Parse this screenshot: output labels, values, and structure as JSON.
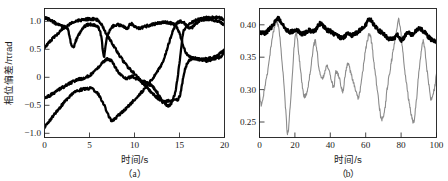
{
  "figure": {
    "background_color": "#ffffff",
    "text_color": "#1a1a1a",
    "black_curve_color": "#000000",
    "gray_curve_color": "#8c8c8c"
  },
  "panel_a": {
    "caption": "（a）",
    "xlabel": "时间/s",
    "ylabel": "相位偏差/πrad",
    "xticks": [
      "0",
      "5",
      "10",
      "15",
      "20"
    ],
    "yticks": [
      "1.0",
      "0.5",
      "0",
      "−0.5",
      "−1.0"
    ]
  },
  "panel_b": {
    "caption": "（b）",
    "xlabel": "时间/s",
    "xticks": [
      "0",
      "20",
      "40",
      "60",
      "80",
      "100"
    ],
    "yticks": [
      "0.25",
      "0.30",
      "0.35",
      "0.40"
    ]
  },
  "chart_data": [
    {
      "type": "line",
      "id": "panel-a",
      "title": "",
      "subtitle": "（a）",
      "xlabel": "时间/s",
      "ylabel": "相位偏差/πrad",
      "xlim": [
        0,
        20
      ],
      "ylim": [
        -1.15,
        1.15
      ],
      "xticks": [
        0,
        5,
        10,
        15,
        20
      ],
      "yticks": [
        1.0,
        0.5,
        0,
        -0.5,
        -1.0
      ],
      "grid": false,
      "legend": "none",
      "noise": "all traces carry fine high-frequency jitter of roughly ±0.02 πrad",
      "series": [
        {
          "name": "trace-1",
          "color": "#000000",
          "linewidth": "thick",
          "x": [
            0,
            0.6,
            1.3,
            2.0,
            2.6,
            3.1,
            3.6,
            4.2,
            4.8,
            5.4,
            5.9,
            6.3,
            6.6,
            6.9,
            7.4,
            8.0,
            8.6,
            9.2,
            9.6,
            10.0,
            10.6,
            11.2,
            11.8,
            12.4,
            13.0,
            13.6,
            14.2,
            14.6,
            15.0,
            15.6,
            16.2,
            16.8,
            17.4,
            18.0,
            18.6,
            19.2,
            19.6,
            20
          ],
          "y": [
            0.99,
            0.95,
            0.88,
            0.83,
            0.78,
            0.45,
            0.62,
            0.79,
            0.86,
            0.86,
            0.83,
            0.66,
            0.3,
            0.62,
            0.8,
            0.86,
            0.84,
            0.8,
            0.88,
            0.83,
            0.8,
            0.83,
            0.86,
            0.88,
            0.9,
            0.9,
            0.88,
            0.84,
            0.7,
            0.4,
            0.28,
            0.26,
            0.24,
            0.25,
            0.27,
            0.3,
            0.36,
            0.42
          ]
        },
        {
          "name": "trace-2",
          "color": "#000000",
          "linewidth": "thick",
          "x": [
            0,
            0.8,
            1.6,
            2.4,
            3.2,
            4.0,
            4.8,
            5.6,
            6.2,
            6.8,
            7.4,
            8.0,
            8.6,
            9.2,
            9.6,
            10.2,
            10.8,
            11.4,
            12.0,
            12.6,
            13.2,
            13.8,
            14.2,
            14.6,
            15.0,
            15.4,
            16.0,
            16.6,
            17.2,
            17.8,
            18.4,
            19.0,
            19.5,
            20
          ],
          "y": [
            0.46,
            0.6,
            0.72,
            0.83,
            0.9,
            0.94,
            0.96,
            0.96,
            0.9,
            0.72,
            0.56,
            0.4,
            0.25,
            0.12,
            0.05,
            -0.05,
            -0.16,
            -0.26,
            -0.36,
            -0.45,
            -0.52,
            -0.58,
            -0.5,
            -0.28,
            0.18,
            0.72,
            0.86,
            0.92,
            0.96,
            0.98,
            0.99,
            0.99,
            0.98,
            0.95
          ]
        },
        {
          "name": "trace-3",
          "color": "#000000",
          "linewidth": "thick",
          "x": [
            0,
            0.6,
            1.2,
            1.8,
            2.4,
            3.0,
            3.6,
            4.2,
            4.8,
            5.4,
            6.0,
            6.6,
            7.0,
            7.4,
            7.8,
            8.2,
            8.6,
            9.0,
            9.4,
            9.8,
            10.2,
            10.8,
            11.4,
            12.0,
            12.4,
            12.8,
            13.2,
            13.8,
            14.4,
            15.0,
            15.6,
            16.2,
            16.8,
            17.4,
            18.0,
            18.6,
            19.2,
            19.6,
            20
          ],
          "y": [
            -0.44,
            -0.4,
            -0.34,
            -0.28,
            -0.22,
            -0.17,
            -0.12,
            -0.1,
            -0.06,
            0.0,
            0.1,
            0.2,
            0.25,
            0.22,
            0.12,
            0.02,
            -0.04,
            -0.1,
            -0.08,
            -0.06,
            -0.1,
            -0.14,
            -0.18,
            -0.24,
            -0.32,
            -0.42,
            -0.5,
            -0.5,
            -0.48,
            -0.42,
            0.06,
            0.24,
            0.26,
            0.24,
            0.22,
            0.24,
            0.26,
            0.3,
            0.38
          ]
        },
        {
          "name": "trace-4",
          "color": "#000000",
          "linewidth": "thick",
          "x": [
            0,
            0.5,
            1.0,
            1.6,
            2.2,
            2.8,
            3.4,
            4.0,
            4.6,
            5.2,
            5.8,
            6.2,
            6.6,
            7.0,
            7.4,
            7.8,
            8.2,
            8.6,
            9.0,
            9.6,
            10.2,
            10.8,
            11.4,
            12.0,
            12.6,
            13.2,
            13.8,
            14.4,
            15.0,
            15.6,
            16.2,
            16.8,
            17.4,
            18.0,
            18.6,
            19.2,
            19.6,
            20
          ],
          "y": [
            -0.96,
            -0.86,
            -0.76,
            -0.64,
            -0.52,
            -0.42,
            -0.34,
            -0.3,
            -0.28,
            -0.28,
            -0.34,
            -0.44,
            -0.56,
            -0.72,
            -0.84,
            -0.82,
            -0.76,
            -0.7,
            -0.64,
            -0.54,
            -0.44,
            -0.34,
            -0.22,
            -0.1,
            0.04,
            0.22,
            0.52,
            0.8,
            0.92,
            0.88,
            0.8,
            0.88,
            0.94,
            0.96,
            0.95,
            0.93,
            0.9,
            0.86
          ]
        }
      ]
    },
    {
      "type": "line",
      "id": "panel-b",
      "title": "",
      "subtitle": "（b）",
      "xlabel": "时间/s",
      "ylabel": "",
      "xlim": [
        0,
        100
      ],
      "ylim": [
        0.225,
        0.418
      ],
      "xticks": [
        0,
        20,
        40,
        60,
        80,
        100
      ],
      "yticks": [
        0.25,
        0.3,
        0.35,
        0.4
      ],
      "grid": false,
      "legend": "none",
      "series": [
        {
          "name": "stabilized-trace",
          "color": "#000000",
          "linewidth": "thick",
          "description": "nearly flat noisy trace fluctuating about 0.38",
          "x": [
            0,
            2,
            4,
            6,
            8,
            10,
            12,
            14,
            16,
            18,
            20,
            22,
            24,
            26,
            28,
            30,
            32,
            34,
            36,
            38,
            40,
            42,
            44,
            46,
            48,
            50,
            52,
            54,
            56,
            58,
            60,
            62,
            64,
            66,
            68,
            70,
            72,
            74,
            76,
            78,
            80,
            82,
            84,
            86,
            88,
            90,
            92,
            94,
            96,
            98,
            100
          ],
          "y": [
            0.382,
            0.381,
            0.383,
            0.388,
            0.394,
            0.403,
            0.399,
            0.39,
            0.385,
            0.383,
            0.386,
            0.384,
            0.38,
            0.382,
            0.385,
            0.383,
            0.387,
            0.395,
            0.392,
            0.386,
            0.384,
            0.38,
            0.377,
            0.374,
            0.376,
            0.381,
            0.378,
            0.38,
            0.384,
            0.389,
            0.394,
            0.402,
            0.396,
            0.389,
            0.384,
            0.38,
            0.375,
            0.372,
            0.374,
            0.378,
            0.371,
            0.376,
            0.382,
            0.379,
            0.383,
            0.388,
            0.385,
            0.38,
            0.374,
            0.37,
            0.368
          ]
        },
        {
          "name": "free-running-trace",
          "color": "#8c8c8c",
          "linewidth": "thin",
          "description": "large-amplitude oscillation between about 0.23 and 0.40",
          "x": [
            0,
            1,
            3,
            5,
            7,
            9,
            11,
            13,
            15,
            16,
            18,
            20,
            21,
            23,
            25,
            27,
            29,
            31,
            32,
            34,
            36,
            38,
            40,
            42,
            43,
            45,
            47,
            49,
            50,
            52,
            54,
            56,
            58,
            60,
            62,
            63,
            65,
            67,
            69,
            71,
            72,
            74,
            76,
            78,
            79,
            81,
            83,
            85,
            87,
            88,
            90,
            92,
            93,
            95,
            97,
            99,
            100
          ],
          "y": [
            0.29,
            0.274,
            0.3,
            0.33,
            0.37,
            0.395,
            0.386,
            0.33,
            0.262,
            0.232,
            0.296,
            0.372,
            0.376,
            0.33,
            0.288,
            0.296,
            0.33,
            0.366,
            0.362,
            0.322,
            0.316,
            0.332,
            0.318,
            0.3,
            0.322,
            0.316,
            0.294,
            0.328,
            0.334,
            0.318,
            0.3,
            0.286,
            0.318,
            0.356,
            0.38,
            0.372,
            0.33,
            0.286,
            0.252,
            0.27,
            0.296,
            0.33,
            0.362,
            0.392,
            0.398,
            0.352,
            0.306,
            0.27,
            0.248,
            0.266,
            0.32,
            0.366,
            0.362,
            0.318,
            0.282,
            0.3,
            0.322
          ]
        }
      ]
    }
  ]
}
